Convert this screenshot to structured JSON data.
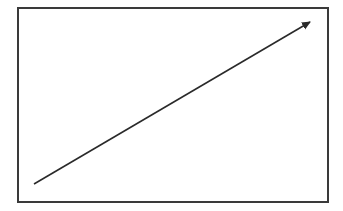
{
  "diagram": {
    "frame": {
      "stroke": "#3a3a3a"
    },
    "arrow": {
      "start": [
        34,
        184
      ],
      "end": [
        310,
        22
      ],
      "color": "#2a2a2a",
      "head": "arrow-icon"
    }
  }
}
